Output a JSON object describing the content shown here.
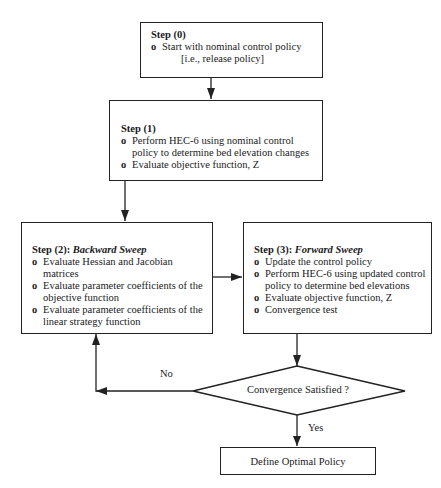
{
  "flowchart": {
    "step0": {
      "title": "Step (0)",
      "items": [
        "Start with nominal control policy"
      ],
      "note": "[i.e., release policy]"
    },
    "step1": {
      "title": "Step (1)",
      "items": [
        "Perform HEC-6 using nominal control policy to determine bed elevation changes",
        "Evaluate objective function, Z"
      ]
    },
    "step2": {
      "title_prefix": "Step (2): ",
      "title_italic": "Backward Sweep",
      "items": [
        "Evaluate Hessian and Jacobian matrices",
        "Evaluate parameter coefficients of the objective function",
        "Evaluate parameter coefficients of the linear strategy function"
      ]
    },
    "step3": {
      "title_prefix": "Step (3): ",
      "title_italic": "Forward Sweep",
      "items": [
        "Update the control policy",
        "Perform HEC-6 using updated control policy to determine bed elevations",
        "Evaluate objective function, Z",
        "Convergence test"
      ]
    },
    "decision": {
      "label": "Convergence Satisfied ?",
      "no_label": "No",
      "yes_label": "Yes"
    },
    "final": {
      "label": "Define Optimal Policy"
    }
  }
}
